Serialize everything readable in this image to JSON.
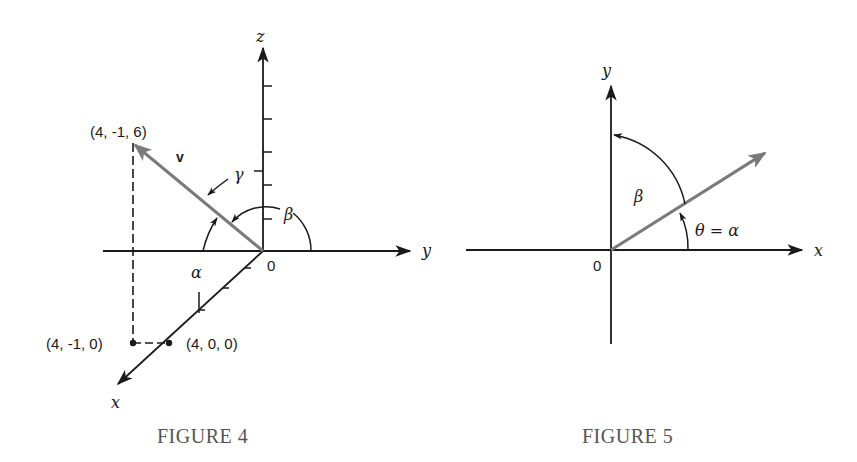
{
  "figure4": {
    "caption": "FIGURE 4",
    "axes": {
      "x_label": "x",
      "y_label": "y",
      "z_label": "z",
      "origin_label": "0"
    },
    "vector": {
      "label": "v",
      "tip_label": "(4, -1, 6)",
      "components": [
        4,
        -1,
        6
      ]
    },
    "points": [
      {
        "label": "(4, -1, 0)",
        "coords": [
          4,
          -1,
          0
        ]
      },
      {
        "label": "(4, 0, 0)",
        "coords": [
          4,
          0,
          0
        ]
      }
    ],
    "angles": {
      "alpha": "α",
      "beta": "β",
      "gamma": "γ"
    },
    "colors": {
      "axis": "#1a1a1a",
      "vector": "#7a7a7a",
      "caption": "#555555"
    }
  },
  "figure5": {
    "caption": "FIGURE 5",
    "axes": {
      "x_label": "x",
      "y_label": "y",
      "origin_label": "0"
    },
    "angles": {
      "beta": "β",
      "theta_alpha": "θ = α"
    },
    "colors": {
      "axis": "#1a1a1a",
      "vector": "#7a7a7a",
      "caption": "#555555"
    }
  }
}
